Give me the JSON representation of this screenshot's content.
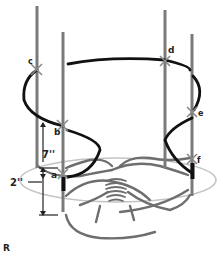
{
  "diagram": {
    "figure_label": "R",
    "points": [
      {
        "id": "a",
        "label": "a"
      },
      {
        "id": "b",
        "label": "b"
      },
      {
        "id": "c",
        "label": "c"
      },
      {
        "id": "d",
        "label": "d"
      },
      {
        "id": "e",
        "label": "e"
      },
      {
        "id": "f",
        "label": "f"
      }
    ],
    "dimensions": {
      "vertical_span": "7''",
      "base_height": "2''"
    },
    "colors": {
      "stake": "#7a7a7a",
      "cord": "#111111",
      "base_ring": "#bdbdbd",
      "roots": "#6e6e6e",
      "cross_mark": "#8a8a8a"
    }
  }
}
